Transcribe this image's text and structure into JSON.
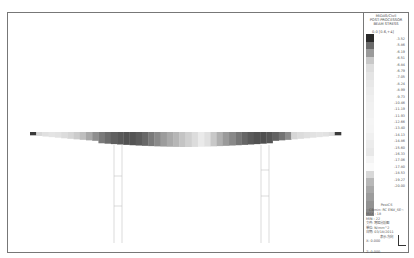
{
  "legend": {
    "title_lines": [
      "MIDAS/Civil",
      "POST-PROCESSOR",
      "BEAM STRESS"
    ],
    "header": "0.0 [0.6,+4]",
    "ticks": [
      "-3.52",
      "-5.86",
      "-6.19",
      "-6.51",
      "-6.84",
      "-6.79",
      "-7.05",
      "-8.24",
      "-8.99",
      "-9.73",
      "-10.46",
      "-11.19",
      "-11.93",
      "-12.66",
      "-13.40",
      "-14.13",
      "-14.86",
      "-15.60",
      "-16.33",
      "-17.06",
      "-17.80",
      "-18.53",
      "-19.27",
      "-20.00"
    ],
    "colors": [
      "#2a2a2a",
      "#6a6a6a",
      "#9a9a9a",
      "#c8c8c8",
      "#dddddd",
      "#e4e4e4",
      "#e8e8e8",
      "#ececec",
      "#efefef",
      "#f1f1f1",
      "#f3f3f3",
      "#f5f5f5",
      "#f4f4f4",
      "#f0f0f0",
      "#ececec",
      "#e8e8e8",
      "#f4f4f4",
      "#fafafa",
      "#d8d8d8",
      "#b8b8b8",
      "#a8a8a8",
      "#9c9c9c",
      "#929292",
      "#888888"
    ]
  },
  "info": {
    "lines": [
      "PostCS",
      "CBmin: RC ENV_SE~",
      "MAX : 18",
      "MIN : 22",
      "文件: 弯矩分析图",
      "单位: N/mm^2",
      "日期: 03/18/2011",
      "表示-方向"
    ],
    "coords": [
      "X: 0.000",
      "Y: -1.000",
      "Z: 0.000"
    ]
  },
  "deck": {
    "segments": [
      "#3a3a3a",
      "#d8d8d8",
      "#e0e0e0",
      "#e4e4e4",
      "#e2e2e2",
      "#dcdcdc",
      "#d6d6d6",
      "#cccccc",
      "#bebebe",
      "#a8a8a8",
      "#8e8e8e",
      "#7a7a7a",
      "#6c6c6c",
      "#606060",
      "#585858",
      "#525252",
      "#545454",
      "#5c5c5c",
      "#686868",
      "#7a7a7a",
      "#8a8a8a",
      "#9c9c9c",
      "#aaaaaa",
      "#b6b6b6",
      "#c4c4c4",
      "#d0d0d0",
      "#dcdcdc",
      "#eaeaea",
      "#e0e0e0",
      "#c8c8c8",
      "#b0b0b0",
      "#9a9a9a",
      "#888888",
      "#767676",
      "#666666",
      "#5a5a5a",
      "#525252",
      "#505050",
      "#565656",
      "#626262",
      "#747474",
      "#8c8c8c",
      "#d6d6d6",
      "#dcdcdc",
      "#e0e0e0",
      "#e2e2e2",
      "#e4e4e4",
      "#e2e2e2",
      "#dcdcdc",
      "#3a3a3a"
    ]
  }
}
